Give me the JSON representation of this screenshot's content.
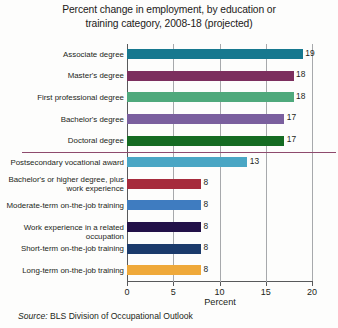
{
  "title": {
    "line1": "Percent change in employment, by education or",
    "line2": "training category, 2008-18 (projected)"
  },
  "source": {
    "label": "Source:",
    "text": " BLS Division of Occupational Outlook"
  },
  "chart_data": {
    "type": "bar",
    "orientation": "horizontal",
    "title": "Percent change in employment, by education or training category, 2008-18 (projected)",
    "xlabel": "Percent",
    "ylabel": "",
    "xlim": [
      0,
      20
    ],
    "xticks": [
      0,
      5,
      10,
      15,
      20
    ],
    "xtick_labels": [
      "0",
      "5",
      "10",
      "15",
      "20"
    ],
    "grid": true,
    "legend": false,
    "categories": [
      "Associate degree",
      "Master's degree",
      "First professional degree",
      "Bachelor's degree",
      "Doctoral degree",
      "Postsecondary vocational award",
      "Bachelor's or higher degree, plus\nwork experience",
      "Moderate-term on-the-job training",
      "Work experience in a related occupation",
      "Short-term on-the-job training",
      "Long-term on-the-job training"
    ],
    "values": [
      19,
      18,
      18,
      17,
      17,
      13,
      8,
      8,
      8,
      8,
      8
    ],
    "value_labels": [
      "19",
      "18",
      "18",
      "17",
      "17",
      "13",
      "8",
      "8",
      "8",
      "8",
      "8"
    ],
    "colors": [
      "#16788f",
      "#7c2f5e",
      "#4fa97c",
      "#7a5f9e",
      "#156b22",
      "#4aa6c4",
      "#a62b3c",
      "#3f7cc0",
      "#221148",
      "#1b3a6b",
      "#efa93a"
    ],
    "divider_after_index": 5,
    "divider_color": "#8e4a6d"
  }
}
